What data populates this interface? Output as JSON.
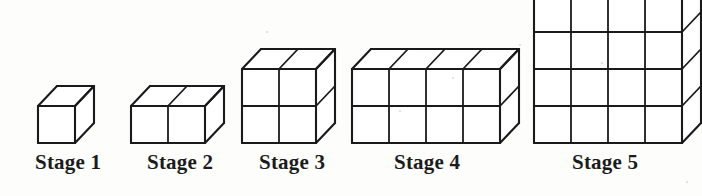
{
  "figure": {
    "background_color": "#fdfdfc",
    "stroke_color": "#1a1a1a",
    "face_color": "#ffffff",
    "label_color": "#1c1c1c"
  },
  "geometry": {
    "cell_width": 37,
    "cell_height": 37,
    "depth_dx": 19,
    "depth_dy": -20,
    "baseline_y": 143,
    "stroke_width": 2.1,
    "stroke_width_inner": 1.8
  },
  "stages": [
    {
      "id": "stage-1",
      "label": "Stage 1",
      "cols": 1,
      "rows": 1,
      "cubes": 1,
      "origin_x": 38,
      "label_center_x": 68,
      "label_y": 152
    },
    {
      "id": "stage-2",
      "label": "Stage 2",
      "cols": 2,
      "rows": 1,
      "cubes": 2,
      "origin_x": 131,
      "label_center_x": 180,
      "label_y": 152
    },
    {
      "id": "stage-3",
      "label": "Stage 3",
      "cols": 2,
      "rows": 2,
      "cubes": 4,
      "origin_x": 242,
      "label_center_x": 292,
      "label_y": 152
    },
    {
      "id": "stage-4",
      "label": "Stage 4",
      "cols": 4,
      "rows": 2,
      "cubes": 8,
      "origin_x": 352,
      "label_center_x": 427,
      "label_y": 152
    },
    {
      "id": "stage-5",
      "label": "Stage 5",
      "cols": 4,
      "rows": 4,
      "cubes": 16,
      "origin_x": 534,
      "label_center_x": 605,
      "label_y": 152
    }
  ],
  "specks": [
    {
      "x": 399,
      "y": 110,
      "size": 2
    },
    {
      "x": 452,
      "y": 77,
      "size": 2
    },
    {
      "x": 601,
      "y": 62,
      "size": 2
    },
    {
      "x": 519,
      "y": 44,
      "size": 2
    },
    {
      "x": 266,
      "y": 31,
      "size": 2
    },
    {
      "x": 686,
      "y": 181,
      "size": 2
    }
  ]
}
